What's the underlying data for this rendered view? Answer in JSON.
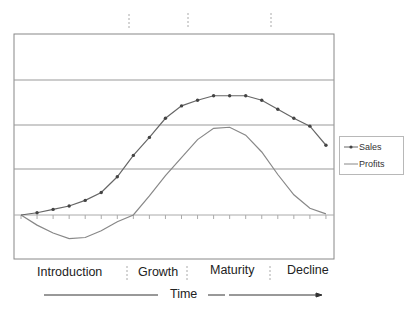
{
  "chart_data": {
    "type": "line",
    "title": "",
    "xlabel": "Time",
    "ylabel": "",
    "x": [
      1,
      2,
      3,
      4,
      5,
      6,
      7,
      8,
      9,
      10,
      11,
      12,
      13,
      14,
      15,
      16,
      17,
      18,
      19,
      20
    ],
    "series": [
      {
        "name": "Sales",
        "color": "#555555",
        "marker": "dot",
        "values": [
          0,
          0.2,
          0.5,
          0.8,
          1.3,
          2.0,
          3.4,
          5.3,
          6.9,
          8.6,
          9.7,
          10.2,
          10.6,
          10.6,
          10.6,
          10.2,
          9.4,
          8.6,
          7.9,
          6.2
        ]
      },
      {
        "name": "Profits",
        "color": "#888888",
        "marker": "none",
        "values": [
          0,
          -0.9,
          -1.6,
          -2.1,
          -2.0,
          -1.4,
          -0.6,
          0,
          1.7,
          3.5,
          5.1,
          6.7,
          7.7,
          7.8,
          7.1,
          5.6,
          3.6,
          1.8,
          0.6,
          0.1
        ]
      }
    ],
    "gridlines_y": [
      4,
      8,
      12
    ],
    "ylim": [
      -4,
      16
    ],
    "grid": true,
    "legend_position": "right",
    "stages": [
      "Introduction",
      "Growth",
      "Maturity",
      "Decline"
    ]
  },
  "stages": {
    "introduction": "Introduction",
    "growth": "Growth",
    "maturity": "Maturity",
    "decline": "Decline"
  },
  "axis": {
    "time_label": "Time"
  },
  "legend": {
    "sales": "Sales",
    "profits": "Profits"
  }
}
